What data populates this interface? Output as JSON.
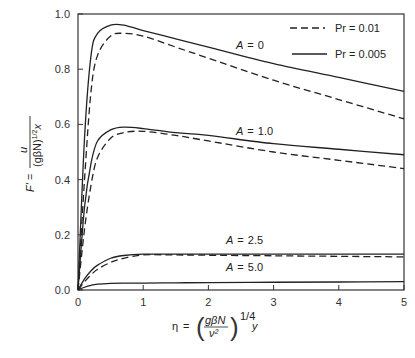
{
  "chart_data": {
    "type": "line",
    "title": "",
    "xlabel": "η = (gβN/ν²)^(1/4) y",
    "ylabel": "F' = u / (gβN)^(1/2) x",
    "xlim": [
      0,
      5
    ],
    "ylim": [
      0,
      1.0
    ],
    "x_ticks": [
      "0",
      "1",
      "2",
      "3",
      "4",
      "5"
    ],
    "y_ticks": [
      "0.0",
      "0.2",
      "0.4",
      "0.6",
      "0.8",
      "1.0"
    ],
    "grid": false,
    "legend": {
      "position": "upper right",
      "entries": [
        {
          "label": "Pr = 0.01",
          "style": "dashed"
        },
        {
          "label": "Pr = 0.005",
          "style": "solid"
        }
      ]
    },
    "annotations": [
      "A = 0",
      "A = 1.0",
      "A = 2.5",
      "A = 5.0"
    ],
    "x": [
      0,
      0.1,
      0.2,
      0.3,
      0.5,
      0.7,
      1.0,
      1.5,
      2.0,
      3.0,
      4.0,
      5.0
    ],
    "series": [
      {
        "name": "A = 0, Pr = 0.005",
        "style": "solid",
        "values": [
          0,
          0.55,
          0.85,
          0.93,
          0.96,
          0.96,
          0.94,
          0.91,
          0.88,
          0.82,
          0.77,
          0.72
        ]
      },
      {
        "name": "A = 0, Pr = 0.01",
        "style": "dashed",
        "values": [
          0,
          0.4,
          0.72,
          0.85,
          0.92,
          0.93,
          0.92,
          0.88,
          0.84,
          0.76,
          0.69,
          0.62
        ]
      },
      {
        "name": "A = 1.0, Pr = 0.005",
        "style": "solid",
        "values": [
          0,
          0.3,
          0.46,
          0.54,
          0.58,
          0.59,
          0.585,
          0.57,
          0.56,
          0.53,
          0.51,
          0.49
        ]
      },
      {
        "name": "A = 1.0, Pr = 0.01",
        "style": "dashed",
        "values": [
          0,
          0.22,
          0.38,
          0.48,
          0.55,
          0.57,
          0.575,
          0.56,
          0.54,
          0.5,
          0.47,
          0.44
        ]
      },
      {
        "name": "A = 2.5, Pr = 0.005",
        "style": "solid",
        "values": [
          0,
          0.04,
          0.07,
          0.09,
          0.115,
          0.125,
          0.13,
          0.13,
          0.13,
          0.13,
          0.13,
          0.13
        ]
      },
      {
        "name": "A = 2.5, Pr = 0.01",
        "style": "dashed",
        "values": [
          0,
          0.03,
          0.055,
          0.075,
          0.1,
          0.115,
          0.127,
          0.127,
          0.126,
          0.124,
          0.122,
          0.12
        ]
      },
      {
        "name": "A = 5.0",
        "style": "solid",
        "values": [
          0,
          0.01,
          0.017,
          0.021,
          0.024,
          0.025,
          0.025,
          0.026,
          0.027,
          0.028,
          0.029,
          0.03
        ]
      }
    ]
  },
  "labels": {
    "y_axis": "F' = u/(gβN)^1/2 x",
    "x_axis": "η = (gβN/ν²)^1/4 y",
    "legend_dashed": "Pr = 0.01",
    "legend_solid": "Pr = 0.005",
    "a0": "A = 0",
    "a1": "A = 1.0",
    "a25": "A = 2.5",
    "a5": "A = 5.0"
  }
}
